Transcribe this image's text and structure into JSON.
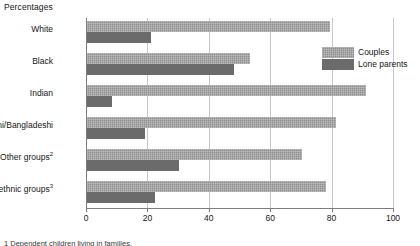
{
  "title": "Percentages",
  "footnote": "1 Dependent children living in families.",
  "axis": {
    "ticks": [
      "0",
      "20",
      "40",
      "60",
      "80",
      "100"
    ],
    "min": 0,
    "max": 100
  },
  "legend": {
    "items": [
      {
        "label": "Couples",
        "color": "#8e8e8e"
      },
      {
        "label": "Lone parents",
        "color": "#6b6b6b"
      }
    ]
  },
  "categories": [
    {
      "label": "White",
      "sup": ""
    },
    {
      "label": "Black",
      "sup": ""
    },
    {
      "label": "Indian",
      "sup": ""
    },
    {
      "label": "Pakistani/Bangladeshi",
      "sup": ""
    },
    {
      "label": "Other groups",
      "sup": "2"
    },
    {
      "label": "All ethnic groups",
      "sup": "3"
    }
  ],
  "chart_data": {
    "type": "bar",
    "orientation": "horizontal",
    "title": "",
    "subtitle": "",
    "xlabel": "Percentages",
    "ylabel": "",
    "xlim": [
      0,
      100
    ],
    "grid": true,
    "legend_position": "top-right",
    "categories": [
      "White",
      "Black",
      "Indian",
      "Pakistani/Bangladeshi",
      "Other groups",
      "All ethnic groups"
    ],
    "series": [
      {
        "name": "Couples",
        "color": "#8e8e8e",
        "values": [
          79,
          53,
          91,
          81,
          70,
          78
        ]
      },
      {
        "name": "Lone parents",
        "color": "#6b6b6b",
        "values": [
          21,
          48,
          8,
          19,
          30,
          22
        ]
      }
    ],
    "xticks": [
      0,
      20,
      40,
      60,
      80,
      100
    ]
  }
}
